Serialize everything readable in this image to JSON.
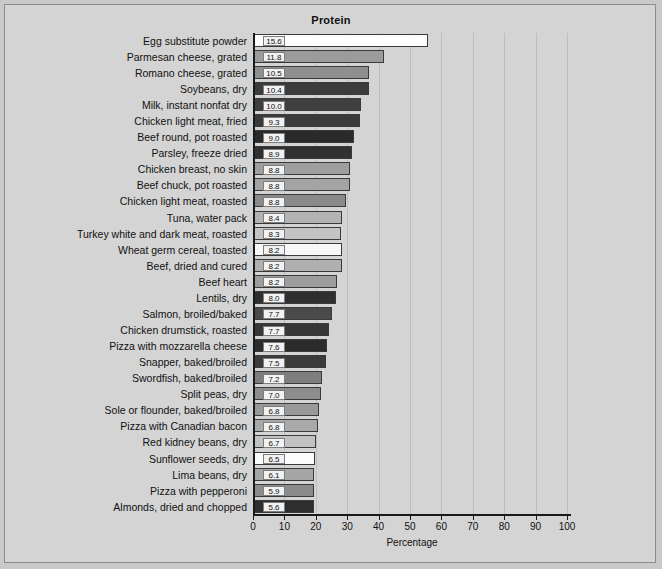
{
  "chart_data": {
    "type": "bar",
    "orientation": "horizontal",
    "title": "Protein",
    "xlabel": "Percentage",
    "ylabel": "",
    "xlim": [
      0,
      100
    ],
    "xticks": [
      0,
      10,
      20,
      30,
      40,
      50,
      60,
      70,
      80,
      90,
      100
    ],
    "grid": true,
    "legend": "none",
    "categories": [
      "Egg substitute powder",
      "Parmesan cheese, grated",
      "Romano cheese, grated",
      "Soybeans, dry",
      "Milk, instant nonfat dry",
      "Chicken light meat, fried",
      "Beef round, pot roasted",
      "Parsley, freeze dried",
      "Chicken breast, no skin",
      "Beef chuck, pot roasted",
      "Chicken light meat, roasted",
      "Tuna, water pack",
      "Turkey white and dark meat, roasted",
      "Wheat germ cereal, toasted",
      "Beef, dried and cured",
      "Beef heart",
      "Lentils, dry",
      "Salmon, broiled/baked",
      "Chicken drumstick, roasted",
      "Pizza with mozzarella cheese",
      "Snapper, baked/broiled",
      "Swordfish, baked/broiled",
      "Split peas, dry",
      "Sole or flounder, baked/broiled",
      "Pizza with Canadian bacon",
      "Red kidney beans, dry",
      "Sunflower seeds, dry",
      "Lima beans, dry",
      "Pizza with pepperoni",
      "Almonds, dried and chopped"
    ],
    "values": [
      55.3,
      41.5,
      36.7,
      36.7,
      34.0,
      33.6,
      32.0,
      31.3,
      30.7,
      30.7,
      29.4,
      28.1,
      27.8,
      28.1,
      28.1,
      26.5,
      26.2,
      24.9,
      24.0,
      23.3,
      23.0,
      21.7,
      21.4,
      20.8,
      20.4,
      19.8,
      19.5,
      19.2,
      19.0,
      19.2
    ],
    "data_labels": [
      "15.6",
      "11.8",
      "10.5",
      "10.4",
      "10.0",
      "9.3",
      "9.0",
      "8.9",
      "8.8",
      "8.8",
      "8.8",
      "8.4",
      "8.3",
      "8.2",
      "8.2",
      "8.2",
      "8.0",
      "7.7",
      "7.7",
      "7.6",
      "7.5",
      "7.2",
      "7.0",
      "6.8",
      "6.8",
      "6.7",
      "6.5",
      "6.1",
      "5.9",
      "5.6"
    ],
    "bar_colors": [
      "#fdfdfd",
      "#9b9b9b",
      "#8f8f8f",
      "#3c3c3c",
      "#3f3f3f",
      "#3a3a3a",
      "#2a2a2a",
      "#303030",
      "#9f9f9f",
      "#a4a4a4",
      "#8a8a8a",
      "#b3b3b3",
      "#c4c4c4",
      "#f7f7f7",
      "#b0b0b0",
      "#9d9d9d",
      "#2f2f2f",
      "#4a4a4a",
      "#373737",
      "#2c2c2c",
      "#3b3b3b",
      "#7e7e7e",
      "#8d8d8d",
      "#999999",
      "#a9a9a9",
      "#c2c2c2",
      "#fbfbfb",
      "#a6a6a6",
      "#8b8b8b",
      "#2e2e2e"
    ]
  }
}
